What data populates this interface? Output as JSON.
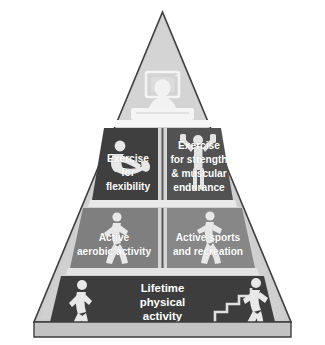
{
  "diagram": {
    "shape": "pyramid",
    "outline_color": "#3a3a3a",
    "background_color": "#ffffff",
    "frame_color": "#c9c9c9",
    "base_strip_color": "#c2c2c2"
  },
  "tiers": [
    {
      "id": "apex",
      "level": 1,
      "position": "top",
      "label": "",
      "fill_color": "#d4d4d4",
      "text_color": "#ffffff",
      "icons": [
        {
          "name": "person-watching-tv-icon",
          "description": "seated figure in front of a television"
        }
      ]
    },
    {
      "id": "tier-2-left",
      "level": 2,
      "position": "left",
      "label": "Exercise for flexibility",
      "lines": [
        "Exercise",
        "for",
        "flexibility"
      ],
      "fill_color": "#3c3c3c",
      "text_color": "#ffffff",
      "icons": [
        {
          "name": "stretching-figure-icon",
          "description": "figure performing a seated stretch"
        }
      ]
    },
    {
      "id": "tier-2-right",
      "level": 2,
      "position": "right",
      "label": "Exercise for strength & muscular endurance",
      "lines": [
        "Exercise",
        "for strength",
        "& muscular",
        "endurance"
      ],
      "fill_color": "#4f4f4f",
      "text_color": "#ffffff",
      "icons": [
        {
          "name": "weightlifter-figure-icon",
          "description": "figure lifting a dumbbell overhead"
        }
      ]
    },
    {
      "id": "tier-3-left",
      "level": 3,
      "position": "left",
      "label": "Active aerobic activity",
      "lines": [
        "Active",
        "aerobic activity"
      ],
      "fill_color": "#7d7d7d",
      "text_color": "#ffffff",
      "icons": [
        {
          "name": "running-figure-icon",
          "description": "figure jogging"
        }
      ]
    },
    {
      "id": "tier-3-right",
      "level": 3,
      "position": "right",
      "label": "Active sports and recreation",
      "lines": [
        "Active sports",
        "and recreation"
      ],
      "fill_color": "#858585",
      "text_color": "#ffffff",
      "icons": [
        {
          "name": "tennis-player-figure-icon",
          "description": "figure swinging a racquet"
        }
      ]
    },
    {
      "id": "tier-4",
      "level": 4,
      "position": "base",
      "label": "Lifetime physical activity",
      "lines": [
        "Lifetime",
        "physical",
        "activity"
      ],
      "fill_color": "#3a3a3a",
      "text_color": "#ffffff",
      "icons": [
        {
          "name": "walking-figure-left-icon",
          "description": "figure walking"
        },
        {
          "name": "stair-climbing-figure-icon",
          "description": "figure climbing stairs"
        },
        {
          "name": "stairs-icon",
          "description": "flight of stairs"
        }
      ]
    }
  ]
}
